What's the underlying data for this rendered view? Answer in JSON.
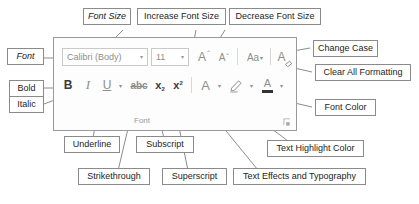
{
  "ribbon": {
    "group_label": "Font",
    "dialog_launcher_name": "font-dialog-launcher-icon",
    "font_name": {
      "value": "Calibri (Body)",
      "caret": "▾"
    },
    "font_size": {
      "value": "11",
      "caret": "▾"
    },
    "buttons": {
      "bold": "B",
      "italic": "I",
      "underline": "U",
      "underline_caret": "▾",
      "strikethrough": "abc",
      "subscript_base": "x",
      "subscript_index": "2",
      "superscript_base": "x",
      "superscript_index": "2",
      "increase_font_size": "A",
      "increase_font_size_mark": "⌃",
      "decrease_font_size": "A",
      "decrease_font_size_mark": "⌄",
      "change_case": "Aa",
      "change_case_caret": "▾",
      "clear_all_formatting": "A",
      "text_effects": "A",
      "text_effects_caret": "▾",
      "highlight_caret": "▾",
      "font_color": "A",
      "font_color_caret": "▾"
    }
  },
  "callouts": {
    "font": "Font",
    "font_size": "Font Size",
    "increase_font_size": "Increase Font Size",
    "decrease_font_size": "Decrease Font Size",
    "change_case": "Change Case",
    "clear_all_formatting": "Clear All Formatting",
    "bold": "Bold",
    "italic": "Italic",
    "font_color": "Font Color",
    "underline": "Underline",
    "subscript": "Subscript",
    "text_highlight_color": "Text Highlight Color",
    "strikethrough": "Strikethrough",
    "superscript": "Superscript",
    "text_effects_and_typography": "Text Effects and Typography"
  },
  "colors": {
    "callout_border": "#8a8a8a",
    "ribbon_border": "#9a9a9a",
    "icon_gray": "#8e8e8e",
    "icon_dark": "#3a3a3a",
    "leader_line": "#6f6f6f",
    "background": "#ffffff"
  }
}
